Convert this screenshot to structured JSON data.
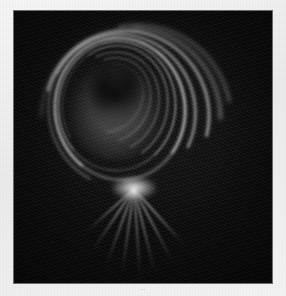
{
  "figure": {
    "kind": "photographic-plate",
    "caption": "—",
    "page_background": "#f1f1f1",
    "plate_background": "#0d0d0e",
    "highlight_color": "#ffffff",
    "core_color": "#9a9a9a",
    "plate": {
      "x": 14,
      "y": 11,
      "width": 258,
      "height": 272
    },
    "focus_point": {
      "x": 120,
      "y": 178
    },
    "core": {
      "cx": 101,
      "cy": 94,
      "rx": 51,
      "ry": 56
    }
  },
  "image_data": {
    "type": "light-streak-photograph",
    "background_level": 0.05,
    "peak_level": 1.0,
    "core_level": 0.36,
    "arcs": [
      {
        "id": 1,
        "cx": 104,
        "cy": 96,
        "rx": 64,
        "ry": 70,
        "rot": -8,
        "span": 300,
        "thickness": 2.0,
        "brightness": 0.95
      },
      {
        "id": 2,
        "cx": 102,
        "cy": 94,
        "rx": 58,
        "ry": 64,
        "rot": 4,
        "span": 285,
        "thickness": 1.6,
        "brightness": 0.8
      },
      {
        "id": 3,
        "cx": 106,
        "cy": 98,
        "rx": 72,
        "ry": 76,
        "rot": -18,
        "span": 260,
        "thickness": 2.4,
        "brightness": 0.7
      },
      {
        "id": 4,
        "cx": 100,
        "cy": 92,
        "rx": 52,
        "ry": 58,
        "rot": 12,
        "span": 250,
        "thickness": 1.4,
        "brightness": 0.6
      },
      {
        "id": 5,
        "cx": 110,
        "cy": 100,
        "rx": 80,
        "ry": 82,
        "rot": -30,
        "span": 215,
        "thickness": 3.0,
        "brightness": 0.55
      },
      {
        "id": 6,
        "cx": 98,
        "cy": 90,
        "rx": 45,
        "ry": 50,
        "rot": 20,
        "span": 230,
        "thickness": 1.2,
        "brightness": 0.48
      },
      {
        "id": 7,
        "cx": 114,
        "cy": 104,
        "rx": 88,
        "ry": 88,
        "rot": -44,
        "span": 175,
        "thickness": 3.4,
        "brightness": 0.42
      },
      {
        "id": 8,
        "cx": 96,
        "cy": 88,
        "rx": 38,
        "ry": 43,
        "rot": 30,
        "span": 210,
        "thickness": 1.0,
        "brightness": 0.38
      },
      {
        "id": 9,
        "cx": 118,
        "cy": 108,
        "rx": 96,
        "ry": 94,
        "rot": -56,
        "span": 150,
        "thickness": 3.8,
        "brightness": 0.32
      },
      {
        "id": 10,
        "cx": 94,
        "cy": 86,
        "rx": 31,
        "ry": 36,
        "rot": 44,
        "span": 190,
        "thickness": 0.9,
        "brightness": 0.28
      }
    ],
    "streaks": [
      {
        "id": 1,
        "angle": -42,
        "length": 78,
        "thickness": 2.2,
        "brightness": 0.7,
        "curve": 1
      },
      {
        "id": 2,
        "angle": -28,
        "length": 86,
        "thickness": 2.0,
        "brightness": 0.66,
        "curve": 1
      },
      {
        "id": 3,
        "angle": -14,
        "length": 90,
        "thickness": 1.8,
        "brightness": 0.6,
        "curve": 1
      },
      {
        "id": 4,
        "angle": -4,
        "length": 92,
        "thickness": 1.6,
        "brightness": 0.55,
        "curve": 0
      },
      {
        "id": 5,
        "angle": 8,
        "length": 88,
        "thickness": 1.8,
        "brightness": 0.58,
        "curve": 0
      },
      {
        "id": 6,
        "angle": 20,
        "length": 84,
        "thickness": 2.0,
        "brightness": 0.62,
        "curve": 0
      },
      {
        "id": 7,
        "angle": 34,
        "length": 76,
        "thickness": 2.2,
        "brightness": 0.66,
        "curve": 0
      },
      {
        "id": 8,
        "angle": 48,
        "length": 66,
        "thickness": 2.4,
        "brightness": 0.6,
        "curve": 0
      }
    ]
  }
}
